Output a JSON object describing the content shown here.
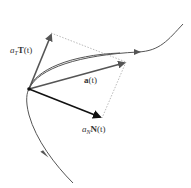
{
  "diagram": {
    "colors": {
      "curve": "#555555",
      "tangent_vector": "#555555",
      "acceleration_vector": "#555555",
      "normal_vector": "#111111",
      "dotted_guides": "#bbbbbb",
      "point": "#111111"
    },
    "labels": {
      "tangent": {
        "coef": "a",
        "sub": "T",
        "vec": "T",
        "arg": "(t)"
      },
      "acceleration": {
        "vec": "a",
        "arg": "(t)"
      },
      "normal": {
        "coef": "a",
        "sub": "N",
        "vec": "N",
        "arg": "(t)"
      }
    },
    "vectors": [
      {
        "name": "tangential-component",
        "from": [
          29,
          89
        ],
        "to": [
          51,
          33
        ]
      },
      {
        "name": "acceleration",
        "from": [
          29,
          89
        ],
        "to": [
          126,
          62
        ]
      },
      {
        "name": "normal-component",
        "from": [
          29,
          89
        ],
        "to": [
          102,
          118
        ]
      }
    ]
  }
}
